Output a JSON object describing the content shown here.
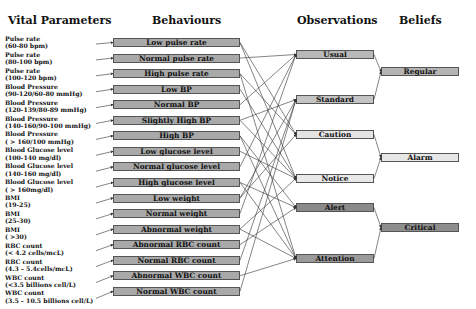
{
  "headers": {
    "vital": "Vital Parameters",
    "behaviours": "Behaviours",
    "observations": "Observations",
    "beliefs": "Beliefs"
  },
  "vitals": [
    {
      "line1": "Pulse rate",
      "line2": "(60-80 bpm)"
    },
    {
      "line1": "Pulse rate",
      "line2": "(80-100 bpm)"
    },
    {
      "line1": "Pulse rate",
      "line2": "(100-120 bpm)"
    },
    {
      "line1": "Blood Pressure",
      "line2": "(90-120/60-80 mmHg)"
    },
    {
      "line1": "Blood Pressure",
      "line2": "(120-139/80-89 mmHg)"
    },
    {
      "line1": "Blood Pressure",
      "line2": "(140-160/90-100 mmHg)"
    },
    {
      "line1": "Blood Pressure",
      "line2": "( > 160/100 mmHg)"
    },
    {
      "line1": "Blood Glucose level",
      "line2": "(100-140 mg/dl)"
    },
    {
      "line1": "Blood Glucose level",
      "line2": "(140-160 mg/dl)"
    },
    {
      "line1": "Blood Glucose level",
      "line2": "( > 160mg/dl)"
    },
    {
      "line1": "BMI",
      "line2": "(19-25)"
    },
    {
      "line1": "BMI",
      "line2": "(25-30)"
    },
    {
      "line1": "BMI",
      "line2": "( >30)"
    },
    {
      "line1": "RBC count",
      "line2": "(< 4.2 cells/mcL)"
    },
    {
      "line1": "RBC count",
      "line2": "(4.3 – 5.4cells/mcL)"
    },
    {
      "line1": "WBC count",
      "line2": "(<3.5 billions cell/L)"
    },
    {
      "line1": "WBC count",
      "line2": "(3.5 – 10.5 billions cell/L)"
    }
  ],
  "behaviours": [
    "Low pulse rate",
    "Normal  pulse rate",
    "High pulse rate",
    "Low BP",
    "Normal BP",
    "Slightly High BP",
    "High BP",
    "Low glucose level",
    "Normal glucose level",
    "High glucose level",
    "Low weight",
    "Normal weight",
    "Abnormal weight",
    "Abnormal RBC count",
    "Normal RBC count",
    "Abnormal WBC count",
    "Normal WBC count"
  ],
  "observations": [
    {
      "label": "Usual",
      "color": "#b8b8b8"
    },
    {
      "label": "Standard",
      "color": "#c4c4c4"
    },
    {
      "label": "Caution",
      "color": "#e4e4e4"
    },
    {
      "label": "Notice",
      "color": "#e8e8e8"
    },
    {
      "label": "Alert",
      "color": "#8a8a8a"
    },
    {
      "label": "Attention",
      "color": "#9a9a9a"
    }
  ],
  "beliefs": [
    {
      "label": "Regular",
      "color": "#b4b4b4"
    },
    {
      "label": "Alarm",
      "color": "#e6e6e6"
    },
    {
      "label": "Critical",
      "color": "#8e8e8e"
    }
  ],
  "colors": {
    "behaviour_fill": "#a9a9a9",
    "edge": "#333333",
    "border": "#555555"
  }
}
